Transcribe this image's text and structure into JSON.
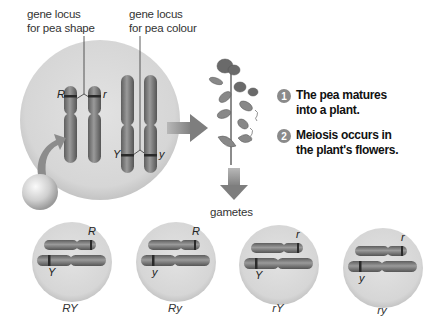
{
  "labels": {
    "shape_locus": [
      "gene locus",
      "for pea shape"
    ],
    "colour_locus": [
      "gene locus",
      "for pea colour"
    ],
    "gametes": "gametes"
  },
  "alleles": {
    "shape_pair": [
      "R",
      "r"
    ],
    "colour_pair": [
      "Y",
      "y"
    ]
  },
  "steps": [
    {
      "number": "1",
      "text": [
        "The pea matures",
        "into a plant."
      ]
    },
    {
      "number": "2",
      "text": [
        "Meiosis occurs in",
        "the plant's flowers."
      ]
    }
  ],
  "gametes": [
    {
      "shape_allele": "R",
      "colour_allele": "Y",
      "label": "RY"
    },
    {
      "shape_allele": "R",
      "colour_allele": "y",
      "label": "Ry"
    },
    {
      "shape_allele": "r",
      "colour_allele": "Y",
      "label": "rY"
    },
    {
      "shape_allele": "r",
      "colour_allele": "y",
      "label": "ry"
    }
  ],
  "colors": {
    "cell_fill": "#dcdcdc",
    "chromosome": "#7a7a7a",
    "band": "#2a2a2a",
    "arrow": "#8c8c8c",
    "step_marker": "#8a8a8a"
  }
}
